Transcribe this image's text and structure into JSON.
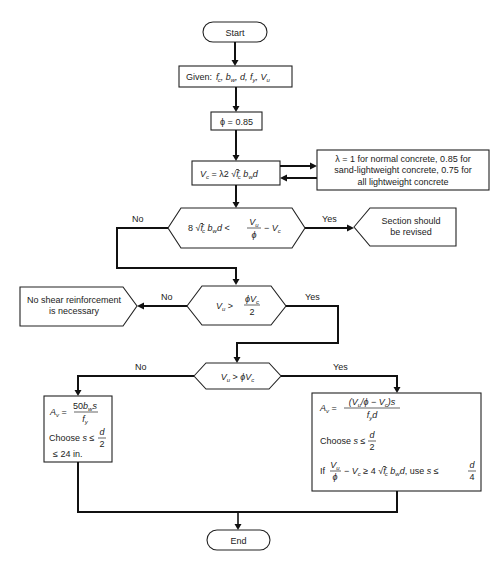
{
  "flowchart": {
    "start": "Start",
    "given": {
      "prefix": "Given:",
      "variables": "f′c, bw, d, fy, Vu"
    },
    "phi": "ϕ = 0.85",
    "vc_formula": "Vc = λ2 √f′c bw d",
    "lambda_note": {
      "line1": "λ = 1 for normal concrete, 0.85 for",
      "line2": "sand-lightweight concrete, 0.75 for",
      "line3": "all lightweight concrete"
    },
    "decision1": {
      "condition": "8√f′c bw d < Vu/ϕ − Vc",
      "yes_label": "Yes",
      "no_label": "No"
    },
    "revise": {
      "line1": "Section should",
      "line2": "be revised"
    },
    "decision2": {
      "condition": "Vu > ϕVc/2",
      "yes_label": "Yes",
      "no_label": "No"
    },
    "no_shear": {
      "line1": "No shear reinforcement",
      "line2": "is necessary"
    },
    "decision3": {
      "condition": "Vu > ϕVc",
      "yes_label": "Yes",
      "no_label": "No"
    },
    "min_reinf": {
      "formula": "Av = 50bw s / fy",
      "choose": "Choose s ≤ d/2",
      "limit": "≤ 24 in."
    },
    "shear_reinf": {
      "formula": "Av = (Vu/ϕ − Vc)s / fy d",
      "choose": "Choose s ≤ d/2",
      "condition": "If Vu/ϕ − Vc ≥ 4√f′c bw d, use s ≤ d/4"
    },
    "end": "End"
  },
  "labels": {
    "start": "Start",
    "end": "End",
    "given": "Given:",
    "phi": "ϕ = 0.85",
    "yes": "Yes",
    "no": "No",
    "choose": "Choose",
    "in24": "≤ 24 in.",
    "if": "If",
    "use": "use",
    "lambda1": "λ = 1 for normal concrete, 0.85 for",
    "lambda2": "sand-lightweight concrete, 0.75 for",
    "lambda3": "all lightweight concrete",
    "revise1": "Section should",
    "revise2": "be revised",
    "noshear1": "No shear reinforcement",
    "noshear2": "is necessary"
  }
}
